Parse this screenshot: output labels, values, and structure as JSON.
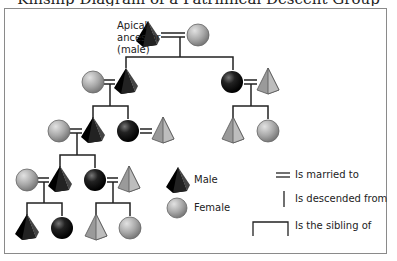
{
  "diagram": {
    "title_partial": "Kinship Diagram of a Patrilineal Descent Group",
    "apical_label": [
      "Apical",
      "ancestor",
      "(male)"
    ],
    "legend": {
      "male": "Male",
      "female": "Female",
      "married": "Is married to",
      "descended": "Is descended from",
      "sibling": "Is the sibling of"
    },
    "colors": {
      "lineage_member": "#111111",
      "non_member": "#9a9a9a",
      "line": "#222222",
      "frame": "#8a8a8a"
    },
    "nodes": [
      {
        "id": "apical",
        "sex": "male",
        "lineage": true,
        "x": 148,
        "y": 35
      },
      {
        "id": "apical-wife",
        "sex": "female",
        "lineage": false,
        "x": 198,
        "y": 35
      },
      {
        "id": "g2-wife",
        "sex": "female",
        "lineage": false,
        "x": 93,
        "y": 82
      },
      {
        "id": "g2-son",
        "sex": "male",
        "lineage": true,
        "x": 126,
        "y": 82
      },
      {
        "id": "g2-daughter",
        "sex": "female",
        "lineage": true,
        "x": 232,
        "y": 82
      },
      {
        "id": "g2-daughter-husband",
        "sex": "male",
        "lineage": false,
        "x": 268,
        "y": 82
      },
      {
        "id": "g3-wife",
        "sex": "female",
        "lineage": false,
        "x": 59,
        "y": 131
      },
      {
        "id": "g3-son",
        "sex": "male",
        "lineage": true,
        "x": 93,
        "y": 131
      },
      {
        "id": "g3-daughter",
        "sex": "female",
        "lineage": true,
        "x": 128,
        "y": 131
      },
      {
        "id": "g3-daughter-husband",
        "sex": "male",
        "lineage": false,
        "x": 163,
        "y": 131
      },
      {
        "id": "g3r-son",
        "sex": "male",
        "lineage": false,
        "x": 233,
        "y": 131
      },
      {
        "id": "g3r-daughter",
        "sex": "female",
        "lineage": false,
        "x": 268,
        "y": 131
      },
      {
        "id": "g4-wife",
        "sex": "female",
        "lineage": false,
        "x": 27,
        "y": 180
      },
      {
        "id": "g4-son",
        "sex": "male",
        "lineage": true,
        "x": 60,
        "y": 180
      },
      {
        "id": "g4-daughter",
        "sex": "female",
        "lineage": true,
        "x": 95,
        "y": 180
      },
      {
        "id": "g4-daughter-husband",
        "sex": "male",
        "lineage": false,
        "x": 129,
        "y": 180
      },
      {
        "id": "g5-son",
        "sex": "male",
        "lineage": true,
        "x": 27,
        "y": 228
      },
      {
        "id": "g5-daughter",
        "sex": "female",
        "lineage": true,
        "x": 62,
        "y": 228
      },
      {
        "id": "g5r-son",
        "sex": "male",
        "lineage": false,
        "x": 96,
        "y": 228
      },
      {
        "id": "g5r-daughter",
        "sex": "female",
        "lineage": false,
        "x": 130,
        "y": 228
      }
    ]
  }
}
